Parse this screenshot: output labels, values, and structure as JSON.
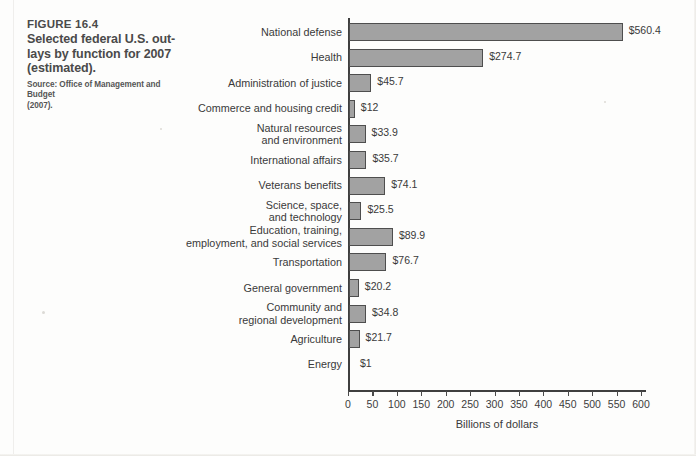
{
  "caption": {
    "figure_number": "FIGURE 16.4",
    "title": "Selected federal U.S. out-lays by function for 2007 (estimated).",
    "title_line1": "Selected federal U.S. out-",
    "title_line2": "lays by function for 2007",
    "title_line3": "(estimated).",
    "source_line1": "Source: Office of Management and Budget",
    "source_line2": "(2007)."
  },
  "chart_data": {
    "type": "bar",
    "orientation": "horizontal",
    "title": "",
    "xlabel": "Billions of dollars",
    "ylabel": "",
    "xlim": [
      0,
      600
    ],
    "xticks": [
      0,
      50,
      100,
      150,
      200,
      250,
      300,
      350,
      400,
      450,
      500,
      550,
      600
    ],
    "xtick_labels": [
      "0",
      "50",
      "100",
      "150",
      "200",
      "250",
      "300",
      "350",
      "400",
      "450",
      "500",
      "550",
      "600"
    ],
    "grid": false,
    "legend": false,
    "bar_color": "#a2a2a2",
    "bar_edge_color": "#4e4e4e",
    "categories": [
      "National defense",
      "Health",
      "Administration of justice",
      "Commerce and housing credit",
      "Natural resources and environment",
      "International affairs",
      "Veterans benefits",
      "Science, space, and technology",
      "Education, training, employment, and social services",
      "Transportation",
      "General government",
      "Community and regional development",
      "Agriculture",
      "Energy"
    ],
    "category_label_lines": [
      [
        "National defense"
      ],
      [
        "Health"
      ],
      [
        "Administration of justice"
      ],
      [
        "Commerce and housing credit"
      ],
      [
        "Natural resources",
        "and environment"
      ],
      [
        "International affairs"
      ],
      [
        "Veterans benefits"
      ],
      [
        "Science, space,",
        "and technology"
      ],
      [
        "Education, training,",
        "employment, and social services"
      ],
      [
        "Transportation"
      ],
      [
        "General government"
      ],
      [
        "Community and",
        "regional development"
      ],
      [
        "Agriculture"
      ],
      [
        "Energy"
      ]
    ],
    "values": [
      560.4,
      274.7,
      45.7,
      12,
      33.9,
      35.7,
      74.1,
      25.5,
      89.9,
      76.7,
      20.2,
      34.8,
      21.7,
      1
    ],
    "value_labels": [
      "$560.4",
      "$274.7",
      "$45.7",
      "$12",
      "$33.9",
      "$35.7",
      "$74.1",
      "$25.5",
      "$89.9",
      "$76.7",
      "$20.2",
      "$34.8",
      "$21.7",
      "$1"
    ]
  }
}
